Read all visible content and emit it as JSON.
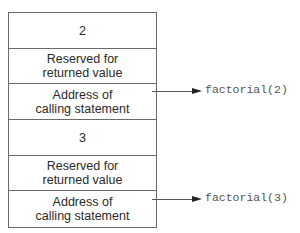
{
  "stack_frames": [
    {
      "parameter_value": "2",
      "reserved_label": "Reserved for\nreturned value",
      "address_label": "Address of\ncalling statement",
      "call_label": "factorial(2)"
    },
    {
      "parameter_value": "3",
      "reserved_label": "Reserved for\nreturned value",
      "address_label": "Address of\ncalling statement",
      "call_label": "factorial(3)"
    }
  ],
  "colors": {
    "border": "#6a6a6a",
    "text": "#2a2a2a",
    "arrow": "#222222",
    "label": "#555555"
  }
}
